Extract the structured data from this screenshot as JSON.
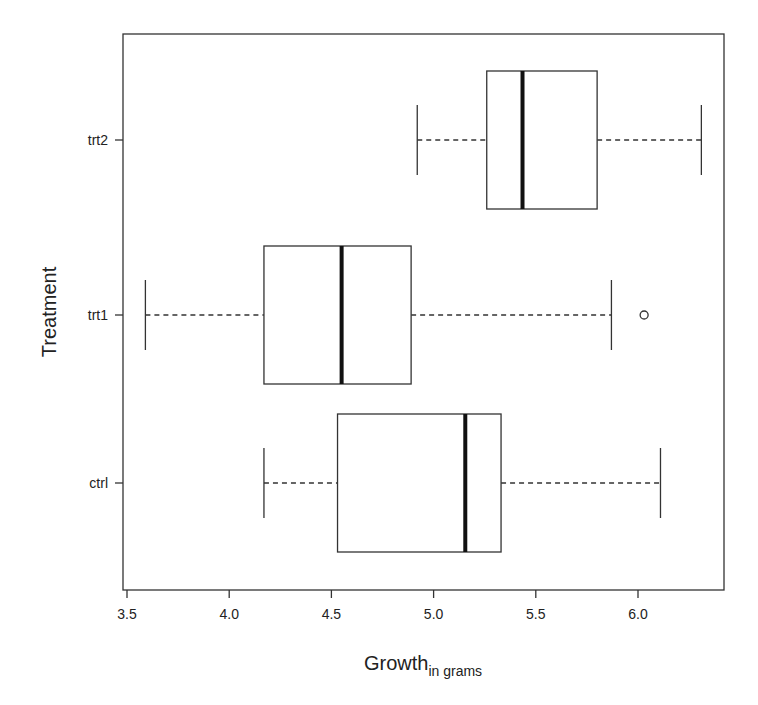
{
  "chart_data": {
    "type": "boxplot",
    "orientation": "horizontal",
    "title": "",
    "xlabel": "Growth",
    "xlabel_subscript": "in grams",
    "ylabel": "Treatment",
    "xlim": [
      3.49,
      6.44
    ],
    "xticks": [
      3.5,
      4.0,
      4.5,
      5.0,
      5.5,
      6.0
    ],
    "xtick_labels": [
      "3.5",
      "4.0",
      "4.5",
      "5.0",
      "5.5",
      "6.0"
    ],
    "categories": [
      "ctrl",
      "trt1",
      "trt2"
    ],
    "series": [
      {
        "name": "ctrl",
        "whisker_low": 4.17,
        "q1": 4.53,
        "median": 5.155,
        "q3": 5.33,
        "whisker_high": 6.11,
        "outliers": []
      },
      {
        "name": "trt1",
        "whisker_low": 3.59,
        "q1": 4.17,
        "median": 4.55,
        "q3": 4.89,
        "whisker_high": 5.87,
        "outliers": [
          6.03
        ]
      },
      {
        "name": "trt2",
        "whisker_low": 4.92,
        "q1": 5.26,
        "median": 5.435,
        "q3": 5.8,
        "whisker_high": 6.31,
        "outliers": []
      }
    ],
    "grid": false,
    "legend": null
  },
  "colors": {
    "line": "#222222",
    "background": "#ffffff"
  }
}
